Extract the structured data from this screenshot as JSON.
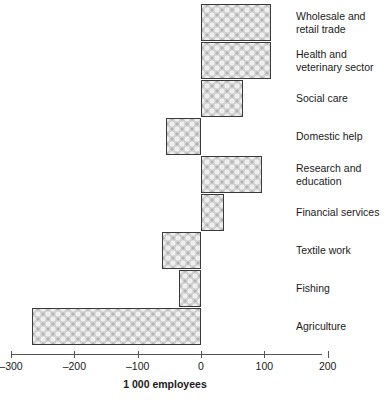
{
  "chart_data": {
    "type": "bar",
    "orientation": "horizontal",
    "title": "",
    "xlabel": "1 000 employees",
    "ylabel": "",
    "xlim": [
      -300,
      200
    ],
    "xticks": [
      -300,
      -200,
      -100,
      0,
      100,
      200
    ],
    "xtick_labels": [
      "–300",
      "–200",
      "–100",
      "0",
      "100",
      "200"
    ],
    "grid": false,
    "legend": null,
    "categories": [
      "Wholesale and\nretail trade",
      "Health and\nveterinary sector",
      "Social care",
      "Domestic help",
      "Research and\neducation",
      "Financial services",
      "Textile work",
      "Fishing",
      "Agriculture"
    ],
    "values": [
      110,
      110,
      67,
      -55,
      97,
      37,
      -62,
      -35,
      -267
    ],
    "bars": [
      {
        "label": "Wholesale and\nretail trade",
        "value": 110
      },
      {
        "label": "Health and\nveterinary sector",
        "value": 110
      },
      {
        "label": "Social care",
        "value": 67
      },
      {
        "label": "Domestic help",
        "value": -55
      },
      {
        "label": "Research and\neducation",
        "value": 97
      },
      {
        "label": "Financial services",
        "value": 37
      },
      {
        "label": "Textile work",
        "value": -62
      },
      {
        "label": "Fishing",
        "value": -35
      },
      {
        "label": "Agriculture",
        "value": -267
      }
    ]
  },
  "axis": {
    "x_title": "1 000 employees"
  }
}
